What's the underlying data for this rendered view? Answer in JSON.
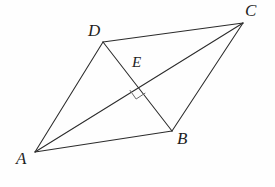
{
  "figure": {
    "background_color": "#fefefe",
    "line_color": "#2b2b2b",
    "mark_color": "#6a6a6a",
    "canvas": {
      "width": 275,
      "height": 187
    },
    "points": {
      "A": {
        "label": "A",
        "x": 35,
        "y": 152,
        "label_x": 16,
        "label_y": 150
      },
      "B": {
        "label": "B",
        "x": 172,
        "y": 131,
        "label_x": 177,
        "label_y": 130
      },
      "C": {
        "label": "C",
        "x": 243,
        "y": 23,
        "label_x": 245,
        "label_y": 2
      },
      "D": {
        "label": "D",
        "x": 103,
        "y": 42,
        "label_x": 88,
        "label_y": 22
      },
      "E": {
        "label": "E",
        "x": 139,
        "y": 84,
        "label_x": 132,
        "label_y": 55
      }
    },
    "segments": [
      {
        "name": "side-AD",
        "from": "A",
        "to": "D"
      },
      {
        "name": "side-DC",
        "from": "D",
        "to": "C"
      },
      {
        "name": "side-CB",
        "from": "C",
        "to": "B"
      },
      {
        "name": "side-BA",
        "from": "B",
        "to": "A"
      },
      {
        "name": "diagonal-AC",
        "from": "A",
        "to": "C"
      },
      {
        "name": "diagonal-DB",
        "from": "D",
        "to": "B"
      }
    ],
    "right_angle": {
      "at": "E",
      "size": 11,
      "note": "square marker below intersection indicating perpendicular diagonals"
    }
  }
}
